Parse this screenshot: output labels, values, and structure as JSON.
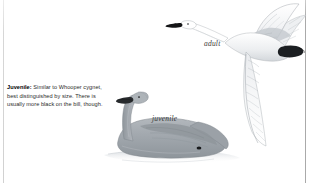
{
  "page": {
    "background_color": "#ffffff",
    "width": 320,
    "height": 183,
    "kind": "field-guide-plate"
  },
  "rules": {
    "left_color": "#c9c9c9",
    "right_color": "#a0a0a0"
  },
  "caption": {
    "lead": "Juvenile:",
    "body": " Similar to Whooper cygnet, best distinguished by size. There is usually more black on the bill, though.",
    "full_text": "Juvenile: Similar to Whooper cygnet, best distinguished by size. There is usually more black on the bill, though.",
    "text_color": "#2b2b2b"
  },
  "labels": {
    "adult": "adult",
    "juvenile": "juvenile"
  },
  "illustration": {
    "adult_bird": {
      "name": "swan-in-flight",
      "pose": "flying, neck outstretched to the left, wings spread",
      "plumage_color": "#ffffff",
      "bill_color": "#1a1a1a",
      "shading_color": "#b8bcc2"
    },
    "juvenile_bird": {
      "name": "swan-swimming",
      "pose": "swimming on water, head up, facing left",
      "plumage_color": "#9aa0a6",
      "bill_color": "#26292c",
      "eye_color": "#161616",
      "water_color": "#d8dce0"
    }
  }
}
